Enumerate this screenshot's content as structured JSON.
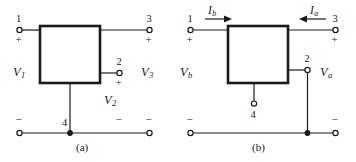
{
  "figure": {
    "kind": "two-port-network-terminal-diagram",
    "background_color": "#ffffff",
    "line_color": "#1a1a1a",
    "panels": [
      {
        "id": "a",
        "caption": "(a)",
        "box_label": "",
        "terminals": [
          {
            "name": "terminal-1",
            "number": "1",
            "polarity": "+"
          },
          {
            "name": "terminal-3",
            "number": "3",
            "polarity": "+"
          },
          {
            "name": "terminal-2",
            "number": "2",
            "polarity": "+"
          },
          {
            "name": "terminal-4",
            "number": "4",
            "polarity": ""
          }
        ],
        "voltages": [
          {
            "name": "voltage-v1",
            "symbol": "V",
            "subscript": "1"
          },
          {
            "name": "voltage-v2",
            "symbol": "V",
            "subscript": "2"
          },
          {
            "name": "voltage-v3",
            "symbol": "V",
            "subscript": "3"
          }
        ],
        "rail_minus_signs": [
          "−",
          "−",
          "−"
        ],
        "currents": []
      },
      {
        "id": "b",
        "caption": "(b)",
        "box_label": "",
        "terminals": [
          {
            "name": "terminal-1",
            "number": "1",
            "polarity": "+"
          },
          {
            "name": "terminal-3",
            "number": "3",
            "polarity": "+"
          },
          {
            "name": "terminal-2",
            "number": "2",
            "polarity": ""
          },
          {
            "name": "terminal-4",
            "number": "4",
            "polarity": ""
          }
        ],
        "voltages": [
          {
            "name": "voltage-vb",
            "symbol": "V",
            "subscript": "b"
          },
          {
            "name": "voltage-va",
            "symbol": "V",
            "subscript": "a"
          }
        ],
        "rail_minus_signs": [
          "−",
          "−"
        ],
        "currents": [
          {
            "name": "current-ib",
            "symbol": "I",
            "subscript": "b",
            "direction": "right"
          },
          {
            "name": "current-ia",
            "symbol": "I",
            "subscript": "a",
            "direction": "left"
          }
        ]
      }
    ]
  },
  "panel_a": {
    "caption": "(a)",
    "t1_num": "1",
    "t1_plus": "+",
    "t3_num": "3",
    "t3_plus": "+",
    "t2_num": "2",
    "t2_plus": "+",
    "t4_num": "4",
    "v1_sym": "V",
    "v1_sub": "1",
    "v2_sym": "V",
    "v2_sub": "2",
    "v3_sym": "V",
    "v3_sub": "3",
    "minus_left": "−",
    "minus_mid": "−",
    "minus_right": "−"
  },
  "panel_b": {
    "caption": "(b)",
    "t1_num": "1",
    "t1_plus": "+",
    "t3_num": "3",
    "t3_plus": "+",
    "t2_num": "2",
    "t4_num": "4",
    "vb_sym": "V",
    "vb_sub": "b",
    "va_sym": "V",
    "va_sub": "a",
    "ib_sym": "I",
    "ib_sub": "b",
    "ia_sym": "I",
    "ia_sub": "a",
    "minus_left": "−",
    "minus_right": "−"
  }
}
